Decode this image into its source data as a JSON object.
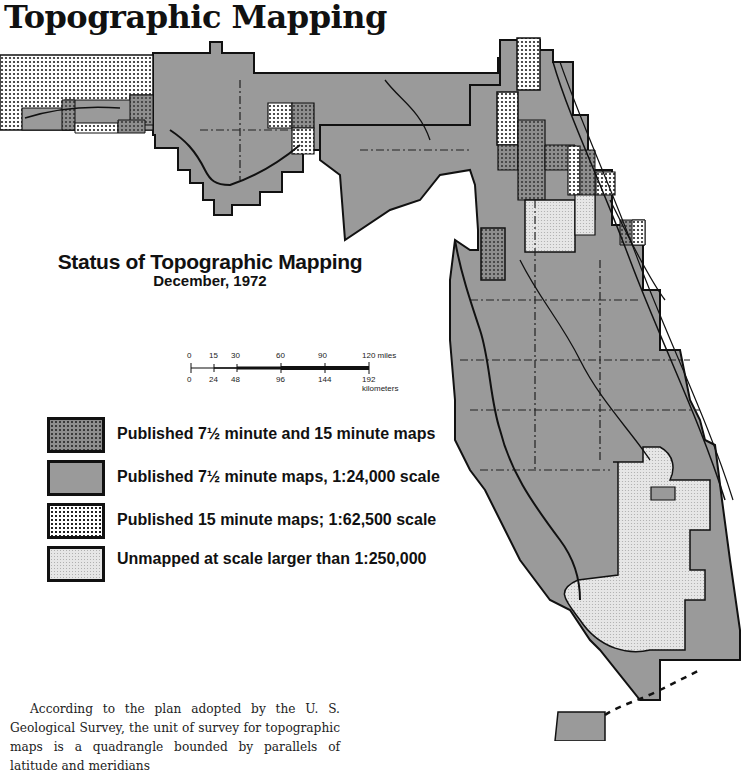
{
  "page": {
    "title": "Topographic Mapping"
  },
  "map": {
    "heading": "Status of Topographic Mapping",
    "subheading": "December, 1972",
    "region": "Florida",
    "colors": {
      "published_both": "#8e8e8e",
      "published_7_5": "#9a9a9a",
      "published_15": "#ffffff",
      "unmapped": "#e6e6e6",
      "outline": "#111111"
    }
  },
  "scale_bar": {
    "miles_ticks": [
      "0",
      "15",
      "30",
      "60",
      "90",
      "120 miles"
    ],
    "km_ticks": [
      "0",
      "24",
      "48",
      "96",
      "144",
      "192 kilometers"
    ]
  },
  "legend": {
    "items": [
      {
        "key": "published_both",
        "label": "Published 7½ minute and 15 minute maps"
      },
      {
        "key": "published_7_5",
        "label": "Published 7½ minute maps, 1:24,000 scale"
      },
      {
        "key": "published_15",
        "label": "Published 15 minute maps; 1:62,500 scale"
      },
      {
        "key": "unmapped",
        "label": "Unmapped at scale larger than 1:250,000"
      }
    ]
  },
  "body_text": {
    "paragraph": "According to the plan adopted by the U. S. Geological Survey, the unit of survey for topographic maps is a quadrangle bounded by parallels of latitude and meridians"
  }
}
